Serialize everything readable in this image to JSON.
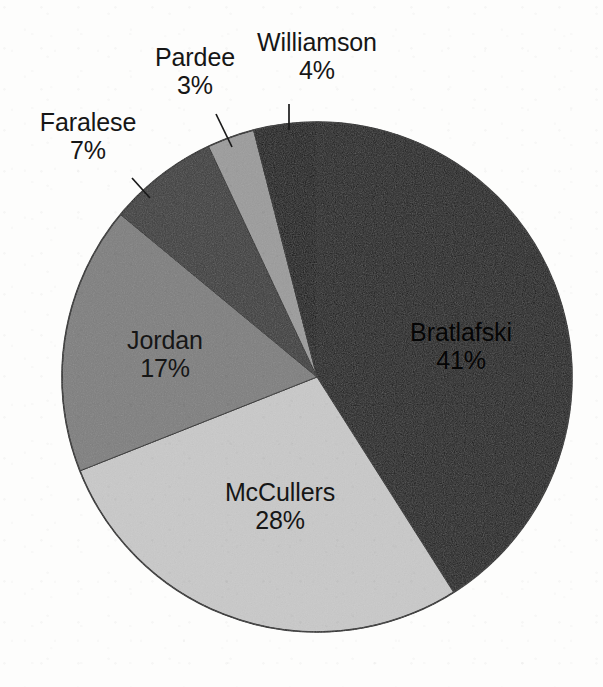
{
  "chart_data": {
    "type": "pie",
    "title": "",
    "subtitle": "",
    "xlabel": "",
    "ylabel": "",
    "legend_position": "none",
    "labels_position": "inside-and-callout",
    "grid": false,
    "units": "percent",
    "start_angle_deg": 0,
    "direction": "clockwise",
    "categories": [
      "Bratlafski",
      "McCullers",
      "Jordan",
      "Faralese",
      "Pardee",
      "Williamson"
    ],
    "values": [
      41,
      28,
      17,
      7,
      3,
      4
    ],
    "value_labels": [
      "41%",
      "28%",
      "17%",
      "7%",
      "3%",
      "4%"
    ],
    "colors": [
      "#1b1b1b",
      "#c9c9c9",
      "#7e7e7e",
      "#3b3b3b",
      "#9b9b9b",
      "#121212"
    ],
    "slices": [
      {
        "name": "Bratlafski",
        "value": 41,
        "value_label": "41%",
        "color": "#1b1b1b",
        "label_style": "inside",
        "text_color": "#050505"
      },
      {
        "name": "McCullers",
        "value": 28,
        "value_label": "28%",
        "color": "#c9c9c9",
        "label_style": "inside",
        "text_color": "#161616"
      },
      {
        "name": "Jordan",
        "value": 17,
        "value_label": "17%",
        "color": "#7e7e7e",
        "label_style": "inside",
        "text_color": "#161616"
      },
      {
        "name": "Faralese",
        "value": 7,
        "value_label": "7%",
        "color": "#3b3b3b",
        "label_style": "callout",
        "text_color": "#161616"
      },
      {
        "name": "Pardee",
        "value": 3,
        "value_label": "3%",
        "color": "#9b9b9b",
        "label_style": "callout",
        "text_color": "#161616"
      },
      {
        "name": "Williamson",
        "value": 4,
        "value_label": "4%",
        "color": "#121212",
        "label_style": "callout",
        "text_color": "#161616"
      }
    ]
  },
  "figure": {
    "background_color": "#fdfdfc",
    "outline_color": "#2a2a2a",
    "center_x": 317,
    "center_y": 377,
    "radius": 255
  }
}
